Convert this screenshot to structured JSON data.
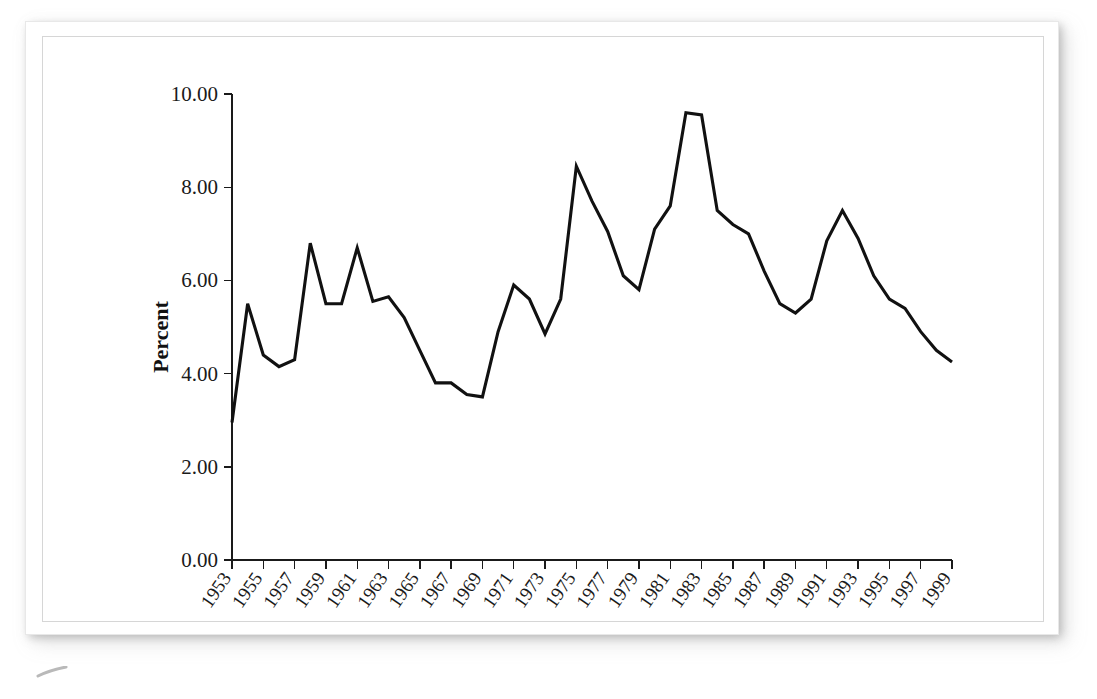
{
  "figure": {
    "background_color": "#ffffff",
    "frame_color": "#d6d6d6",
    "line_color": "#111111"
  },
  "axis": {
    "y_label": "Percent",
    "y_ticks": [
      "0.00",
      "2.00",
      "4.00",
      "6.00",
      "8.00",
      "10.00"
    ],
    "x_ticks": [
      "1953",
      "1955",
      "1957",
      "1959",
      "1961",
      "1963",
      "1965",
      "1967",
      "1969",
      "1971",
      "1973",
      "1975",
      "1977",
      "1979",
      "1981",
      "1983",
      "1985",
      "1987",
      "1989",
      "1991",
      "1993",
      "1995",
      "1997",
      "1999"
    ]
  },
  "chart_data": {
    "type": "line",
    "title": "",
    "subtitle": "",
    "xlabel": "",
    "ylabel": "Percent",
    "xlim": [
      1953,
      1999
    ],
    "ylim": [
      0.0,
      10.0
    ],
    "grid": false,
    "legend": null,
    "x_tick_labels": [
      "1953",
      "1955",
      "1957",
      "1959",
      "1961",
      "1963",
      "1965",
      "1967",
      "1969",
      "1971",
      "1973",
      "1975",
      "1977",
      "1979",
      "1981",
      "1983",
      "1985",
      "1987",
      "1989",
      "1991",
      "1993",
      "1995",
      "1997",
      "1999"
    ],
    "y_tick_labels": [
      "0.00",
      "2.00",
      "4.00",
      "6.00",
      "8.00",
      "10.00"
    ],
    "x": [
      1953,
      1954,
      1955,
      1956,
      1957,
      1958,
      1959,
      1960,
      1961,
      1962,
      1963,
      1964,
      1965,
      1966,
      1967,
      1968,
      1969,
      1970,
      1971,
      1972,
      1973,
      1974,
      1975,
      1976,
      1977,
      1978,
      1979,
      1980,
      1981,
      1982,
      1983,
      1984,
      1985,
      1986,
      1987,
      1988,
      1989,
      1990,
      1991,
      1992,
      1993,
      1994,
      1995,
      1996,
      1997,
      1998,
      1999
    ],
    "series": [
      {
        "name": "Unemployment rate",
        "values": [
          2.95,
          5.5,
          4.4,
          4.15,
          4.3,
          6.8,
          5.5,
          5.5,
          6.7,
          5.55,
          5.65,
          5.2,
          4.5,
          3.8,
          3.8,
          3.55,
          3.5,
          4.9,
          5.9,
          5.6,
          4.85,
          5.6,
          8.45,
          7.7,
          7.05,
          6.1,
          5.8,
          7.1,
          7.6,
          9.6,
          9.55,
          7.5,
          7.2,
          7.0,
          6.2,
          5.5,
          5.3,
          5.6,
          6.85,
          7.5,
          6.9,
          6.1,
          5.6,
          5.4,
          4.9,
          4.5,
          4.25
        ]
      }
    ]
  }
}
